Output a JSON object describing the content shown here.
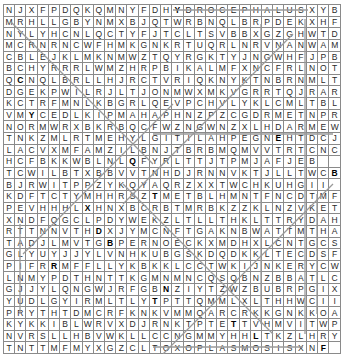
{
  "puzzle": {
    "type": "word-search",
    "rows": 30,
    "cols": 30,
    "grid": [
      "NJXFPDQKQMNYFDHYDROCEPHALUSXYB",
      "MRHLLGBYNMXBJQTWRBNQLBRPDEKXHF",
      "NYLYHCNLQCTYFJTCLTSVBBXGZGHWTD",
      "MCRNRNCWFHMKGNKRTUQRLNRVNANWAM",
      "CBLEJKLMKNMWZTQYRGKTYJNGWHFJPB",
      "BCHYRRRLWMZHRPBIKALMFXNCFRLNOT",
      "QCNQLBRLLHJRCTVRIQKNYKTNBRNMLT",
      "DGEKPWILRJLTJONMWXMKVGRRTQJRAR",
      "KCTRFMNLKBGRLQEVPCHVLYKLCMLTBL",
      "VMYCEDLKIPMAHAPHNZPZCGDRMETNPR",
      "NORMWRXBKRBQCFWZNGWNZXLHDARMEW",
      "TNKZMLRTMEHYLGITILAHPEGNEHTDCJ",
      "LACVXMFAMZILBNJTBRBMQMVVTRTCNC",
      "HCFBKKWBLNLQFYRLTTJTPMJAFJEB",
      "TCWILBTXBBVVTNHDJRNNVKTJLLTWCB",
      "BJRWITPPZYKQYAQRZXXTWCHKUHGII",
      "KDFTCTYMHHRSZTMETBLHMNTFNCDTMF",
      "PEVHHHLXHNXBCRBTMRBKZZKLNZVKET",
      "XNDFQGCLPDYWEKZLTLLTHKLTTRYDAH",
      "RTTNNVTHDXJYMCNFTGAKNBWATTMTHA",
      "TADJLMVTGBPERNOECKXMDHXLCNTGCS",
      "GLYUYJJYLVNHKUBGSKDQDKKLTECDSF",
      "PIFRRMFFLLYKBKKLCCTWKIJNKERYCWIH",
      "LNMYPDTHNTTKGMNMNCQSQBNZBBATLCY",
      "GJJYLQNGWJRFGBNZIYTZWZBUBRPGIX",
      "YUDLGYIRMLTLYTPTTQMMLXLTHHWCII",
      "PRYTHTDMCRFKNKVMMQARCRKKGNKKOA",
      "KYKKIBLWRVXDJRNKTPTETTVHMVITWPF",
      "NVRSLLHBVWKLLCCNGMMYHHLTKZLHRYG",
      "TNTTMFMYXGZCLTOXOPLASMOSISXNF"
    ],
    "bold_cells": [
      [
        0,
        15
      ],
      [
        6,
        1
      ],
      [
        9,
        2
      ],
      [
        13,
        11
      ],
      [
        16,
        13
      ],
      [
        17,
        7
      ],
      [
        19,
        8
      ],
      [
        20,
        9
      ],
      [
        22,
        4
      ],
      [
        24,
        14
      ],
      [
        25,
        13
      ],
      [
        27,
        20
      ],
      [
        28,
        22
      ],
      [
        29,
        28
      ],
      [
        14,
        29
      ],
      [
        11,
        24
      ]
    ],
    "colors": {
      "line": "#9a9a9a",
      "border": "#8a8a8a",
      "text": "#2a2a2a",
      "background": "#ffffff"
    }
  }
}
